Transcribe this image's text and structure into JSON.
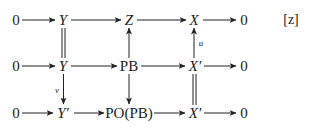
{
  "diagram": {
    "tag": "[z]",
    "rows": [
      {
        "nodes": [
          {
            "label": "0",
            "italic": false
          },
          {
            "label": "Y",
            "italic": true
          },
          {
            "label": "Z",
            "italic": true
          },
          {
            "label": "X",
            "italic": true
          },
          {
            "label": "0",
            "italic": false
          }
        ]
      },
      {
        "nodes": [
          {
            "label": "0",
            "italic": false
          },
          {
            "label": "Y",
            "italic": true
          },
          {
            "label": "PB",
            "italic": false
          },
          {
            "label": "X′",
            "italic": true
          },
          {
            "label": "0",
            "italic": false
          }
        ]
      },
      {
        "nodes": [
          {
            "label": "0",
            "italic": false
          },
          {
            "label": "Y′",
            "italic": true
          },
          {
            "label": "PO(PB)",
            "italic": false
          },
          {
            "label": "X′",
            "italic": true
          },
          {
            "label": "0",
            "italic": false
          }
        ]
      }
    ],
    "vertical_arrows": [
      {
        "from": "Y (row1)",
        "to": "Y (row2)",
        "style": "double-line-equality",
        "label": ""
      },
      {
        "from": "PB",
        "to": "Z",
        "style": "arrow-up",
        "label": ""
      },
      {
        "from": "X′ (row2)",
        "to": "X",
        "style": "arrow-up",
        "label": "u"
      },
      {
        "from": "Y (row2)",
        "to": "Y′",
        "style": "arrow-down",
        "label": "v"
      },
      {
        "from": "PB",
        "to": "PO(PB)",
        "style": "arrow-down",
        "label": ""
      },
      {
        "from": "X′ (row2)",
        "to": "X′ (row3)",
        "style": "double-line-equality",
        "label": ""
      }
    ],
    "labels": {
      "u": "u",
      "v": "v"
    }
  }
}
